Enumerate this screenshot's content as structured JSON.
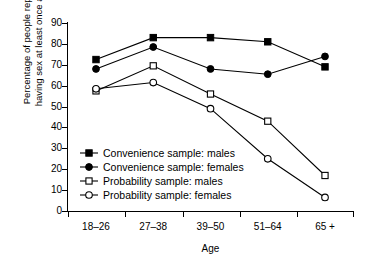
{
  "chart_data": {
    "type": "line",
    "title": "",
    "xlabel": "Age",
    "ylabel_line1": "Percentage of people reporting",
    "ylabel_line2": "having sex at least once a week",
    "categories": [
      "18–26",
      "27–38",
      "39–50",
      "51–64",
      "65 +"
    ],
    "ylim": [
      0,
      90
    ],
    "yticks": [
      0,
      10,
      20,
      30,
      40,
      50,
      60,
      70,
      80,
      90
    ],
    "grid": false,
    "legend_position": "inside-lower-left",
    "series": [
      {
        "name": "Convenience sample: males",
        "marker": "filled-square",
        "values": [
          72.5,
          83.0,
          83.0,
          81.0,
          69.0
        ]
      },
      {
        "name": "Convenience sample: females",
        "marker": "filled-circle",
        "values": [
          68.0,
          78.5,
          68.0,
          65.5,
          74.0
        ]
      },
      {
        "name": "Probability sample: males",
        "marker": "open-square",
        "values": [
          57.5,
          69.5,
          56.0,
          43.0,
          17.0
        ]
      },
      {
        "name": "Probability sample: females",
        "marker": "open-circle",
        "values": [
          58.5,
          61.5,
          49.0,
          25.0,
          6.5
        ]
      }
    ]
  },
  "colors": {
    "ink": "#000000",
    "background": "#ffffff"
  }
}
